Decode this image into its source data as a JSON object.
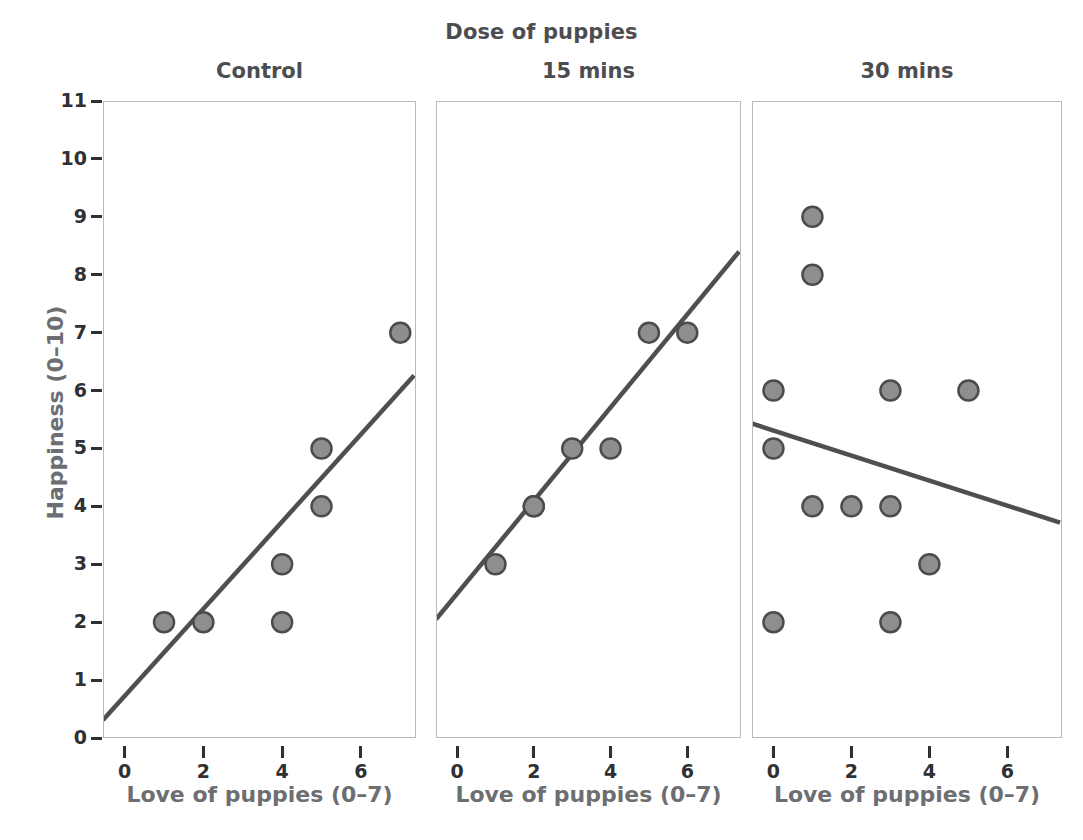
{
  "figure": {
    "super_title": "Dose of puppies",
    "y_axis_title": "Happiness (0–10)",
    "x_axis_title": "Love of puppies (0–7)",
    "marker_fill": "#8d8e90",
    "marker_stroke": "#4b4c4e",
    "line_color": "#4e4f51",
    "frame_color": "#b9bbbe",
    "tick_color": "#2f3033"
  },
  "chart_data": {
    "type": "scatter",
    "title": "Dose of puppies",
    "xlabel": "Love of puppies (0–7)",
    "ylabel": "Happiness (0–10)",
    "xlim": [
      -0.55,
      7.4
    ],
    "ylim": [
      0,
      11
    ],
    "grid": false,
    "legend": "none",
    "facet_variable": "Dose of puppies",
    "xticks": [
      0,
      2,
      4,
      6
    ],
    "yticks": [
      0,
      1,
      2,
      3,
      4,
      5,
      6,
      7,
      8,
      9,
      10,
      11
    ],
    "panels": [
      {
        "label": "Control",
        "points": [
          {
            "x": 1,
            "y": 2
          },
          {
            "x": 2,
            "y": 2
          },
          {
            "x": 4,
            "y": 2
          },
          {
            "x": 4,
            "y": 3
          },
          {
            "x": 5,
            "y": 4
          },
          {
            "x": 5,
            "y": 5
          },
          {
            "x": 7,
            "y": 7
          }
        ],
        "fit_line": {
          "x0": -0.55,
          "y0": 0.31,
          "x1": 7.35,
          "y1": 6.26
        }
      },
      {
        "label": "15 mins",
        "points": [
          {
            "x": 1,
            "y": 3
          },
          {
            "x": 2,
            "y": 4
          },
          {
            "x": 2,
            "y": 4
          },
          {
            "x": 3,
            "y": 5
          },
          {
            "x": 4,
            "y": 5
          },
          {
            "x": 5,
            "y": 7
          },
          {
            "x": 6,
            "y": 7
          }
        ],
        "fit_line": {
          "x0": -0.55,
          "y0": 2.05,
          "x1": 7.35,
          "y1": 8.4
        }
      },
      {
        "label": "30 mins",
        "points": [
          {
            "x": 0,
            "y": 2
          },
          {
            "x": 0,
            "y": 5
          },
          {
            "x": 0,
            "y": 6
          },
          {
            "x": 1,
            "y": 4
          },
          {
            "x": 1,
            "y": 8
          },
          {
            "x": 1,
            "y": 9
          },
          {
            "x": 2,
            "y": 4
          },
          {
            "x": 3,
            "y": 2
          },
          {
            "x": 3,
            "y": 4
          },
          {
            "x": 3,
            "y": 6
          },
          {
            "x": 4,
            "y": 3
          },
          {
            "x": 5,
            "y": 6
          }
        ],
        "fit_line": {
          "x0": -0.55,
          "y0": 5.43,
          "x1": 7.35,
          "y1": 3.72
        }
      }
    ]
  },
  "axis": {
    "y_tick_labels": [
      "0",
      "1",
      "2",
      "3",
      "4",
      "5",
      "6",
      "7",
      "8",
      "9",
      "10",
      "11"
    ],
    "x_tick_labels": [
      "0",
      "2",
      "4",
      "6"
    ]
  }
}
